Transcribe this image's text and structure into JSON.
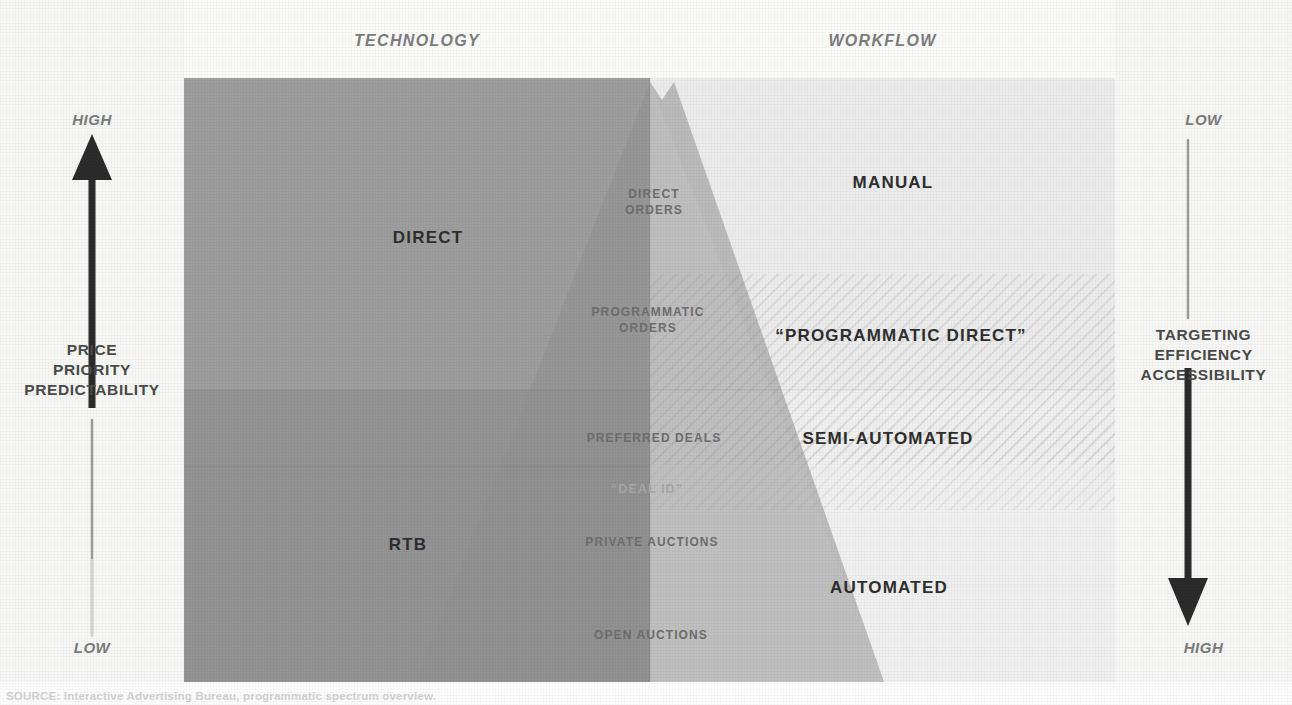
{
  "diagram": {
    "headers": {
      "left": "TECHNOLOGY",
      "right": "WORKFLOW"
    },
    "axes": {
      "left": {
        "top_extreme": "HIGH",
        "bottom_extreme": "LOW",
        "title_line1": "PRICE",
        "title_line2": "PRIORITY",
        "title_line3": "PREDICTABILITY",
        "arrow_direction": "up"
      },
      "right": {
        "top_extreme": "LOW",
        "bottom_extreme": "HIGH",
        "title_line1": "TARGETING",
        "title_line2": "EFFICIENCY",
        "title_line3": "ACCESSIBILITY",
        "arrow_direction": "down"
      }
    },
    "technology_labels": [
      {
        "text": "DIRECT",
        "x": 428,
        "y": 238
      },
      {
        "text": "RTB",
        "x": 408,
        "y": 545
      }
    ],
    "workflow_labels": [
      {
        "text": "MANUAL",
        "x": 893,
        "y": 183
      },
      {
        "text": "“PROGRAMMATIC DIRECT”",
        "x": 901,
        "y": 336
      },
      {
        "text": "SEMI-AUTOMATED",
        "x": 888,
        "y": 439
      },
      {
        "text": "AUTOMATED",
        "x": 889,
        "y": 588
      }
    ],
    "spectrum_labels": [
      {
        "line1": "DIRECT",
        "line2": "ORDERS",
        "x": 654,
        "y": 203,
        "faint": false
      },
      {
        "line1": "PROGRAMMATIC",
        "line2": "ORDERS",
        "x": 648,
        "y": 321,
        "faint": false
      },
      {
        "line1": "PREFERRED DEALS",
        "line2": "",
        "x": 654,
        "y": 439,
        "faint": false
      },
      {
        "line1": "“DEAL ID”",
        "line2": "",
        "x": 647,
        "y": 489,
        "faint": true
      },
      {
        "line1": "PRIVATE AUCTIONS",
        "line2": "",
        "x": 652,
        "y": 543,
        "faint": false
      },
      {
        "line1": "OPEN AUCTIONS",
        "line2": "",
        "x": 651,
        "y": 636,
        "faint": false
      }
    ],
    "colors": {
      "rail_background": "#f7f7f5",
      "header_background": "#fbfbfa",
      "technology_dark": "#9a9a9a",
      "technology_darker": "#8d8d8d",
      "workflow_light": "#eeeeee",
      "workflow_lighter": "#f4f4f4",
      "pyramid_tint": "#b4b4b4",
      "arrow_ink": "#2b2b2b",
      "label_ink": "#2e2e2e",
      "muted_ink": "#7d7d7d"
    },
    "footnote": "SOURCE: Interactive Advertising Bureau, programmatic spectrum overview."
  }
}
